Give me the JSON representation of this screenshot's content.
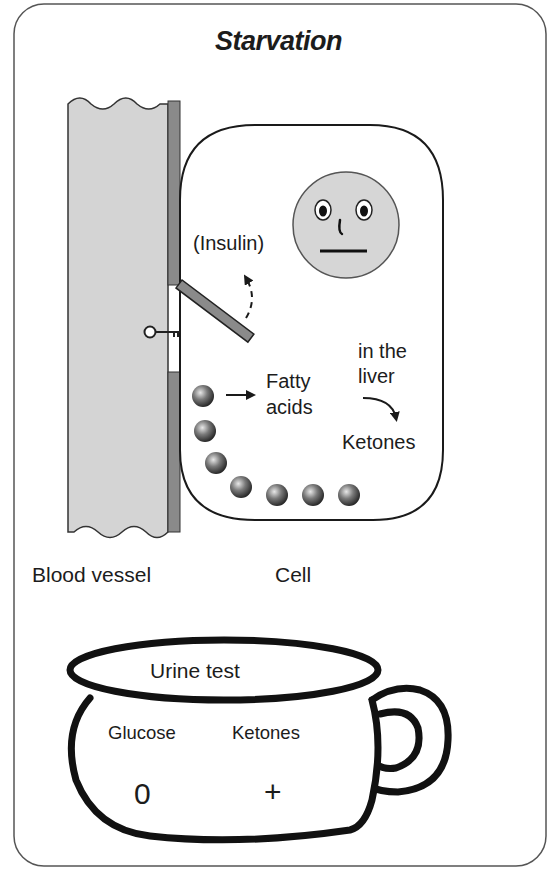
{
  "title": "Starvation",
  "labels": {
    "insulin": "(Insulin)",
    "fatty_acids_line1": "Fatty",
    "fatty_acids_line2": "acids",
    "liver_line1": "in the",
    "liver_line2": "liver",
    "ketones": "Ketones",
    "blood_vessel": "Blood vessel",
    "cell": "Cell"
  },
  "urine_test": {
    "title": "Urine test",
    "columns": [
      {
        "name": "Glucose",
        "value": "0"
      },
      {
        "name": "Ketones",
        "value": "+"
      }
    ]
  },
  "icons": [
    "key-icon",
    "face-icon",
    "arrow-right-icon",
    "curved-arrow-icon",
    "dashed-arrow-icon",
    "cup-icon"
  ],
  "colors": {
    "vessel_fill": "#d4d4d4",
    "membrane_fill": "#8a8a8a",
    "face_fill": "#d6d6d6",
    "outline": "#1a1a1a",
    "frame": "#555555"
  }
}
